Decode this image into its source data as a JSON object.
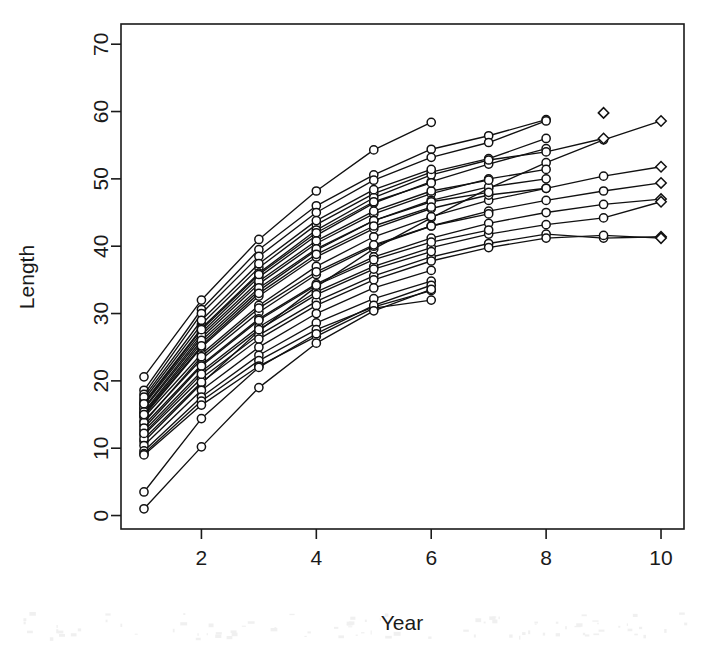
{
  "chart_data": {
    "type": "line",
    "title": "",
    "xlabel": "Year",
    "ylabel": "Length",
    "xlim": [
      0.6,
      10.4
    ],
    "ylim": [
      -2,
      73
    ],
    "xticks": [
      2,
      4,
      6,
      8,
      10
    ],
    "xticklabels": [
      "2",
      "4",
      "6",
      "8",
      "10"
    ],
    "yticks": [
      0,
      10,
      20,
      30,
      40,
      50,
      60,
      70
    ],
    "yticklabels": [
      "0",
      "10",
      "20",
      "30",
      "40",
      "50",
      "60",
      "70"
    ],
    "grid": false,
    "legend": false,
    "marker": "open-circle",
    "end_marker": "open-diamond",
    "line_color": "#111111",
    "marker_fill": "#ffffff",
    "series": [
      {
        "name": "subject-01",
        "x": [
          1,
          2,
          3,
          4,
          5,
          6
        ],
        "values": [
          20.6,
          32.0,
          41.0,
          48.2,
          54.3,
          58.4
        ]
      },
      {
        "name": "subject-02",
        "x": [
          1,
          2,
          3,
          4,
          5,
          6,
          7,
          8
        ],
        "values": [
          18.6,
          30.6,
          39.5,
          46.0,
          50.6,
          54.4,
          56.4,
          58.8
        ]
      },
      {
        "name": "subject-03",
        "x": [
          1,
          2,
          3,
          4,
          5,
          6,
          7,
          8
        ],
        "values": [
          18.0,
          30.0,
          38.5,
          45.0,
          49.8,
          53.2,
          55.4,
          58.6
        ]
      },
      {
        "name": "subject-04",
        "x": [
          1,
          2,
          3,
          4,
          5,
          6,
          7,
          8
        ],
        "values": [
          17.2,
          28.4,
          36.8,
          43.2,
          47.8,
          51.0,
          53.0,
          56.0
        ]
      },
      {
        "name": "subject-05",
        "x": [
          1,
          2,
          3,
          4,
          5,
          6,
          7,
          8
        ],
        "values": [
          16.4,
          27.2,
          35.4,
          41.6,
          46.4,
          49.6,
          52.2,
          54.5
        ]
      },
      {
        "name": "subject-06",
        "x": [
          1,
          2,
          3,
          4,
          5,
          6,
          7,
          8,
          9,
          10
        ],
        "values": [
          11.0,
          19.6,
          27.4,
          34.0,
          39.6,
          44.2,
          48.6,
          52.4,
          55.8,
          58.6
        ]
      },
      {
        "name": "subject-07",
        "x": [
          1,
          2,
          3,
          4,
          5,
          6,
          7,
          8,
          9,
          10
        ],
        "values": [
          14.6,
          24.0,
          31.2,
          37.0,
          41.4,
          44.4,
          46.8,
          48.6,
          50.4,
          51.8
        ]
      },
      {
        "name": "subject-08",
        "x": [
          1,
          2,
          3,
          4,
          5,
          6,
          7,
          8,
          9,
          10
        ],
        "values": [
          14.0,
          23.2,
          30.2,
          35.8,
          40.0,
          43.0,
          45.2,
          46.8,
          48.2,
          49.4
        ]
      },
      {
        "name": "subject-09",
        "x": [
          1,
          2,
          3,
          4,
          5,
          6,
          7,
          8,
          9,
          10
        ],
        "values": [
          13.4,
          22.4,
          29.2,
          34.4,
          38.4,
          41.2,
          43.4,
          45.0,
          46.2,
          47.0
        ]
      },
      {
        "name": "subject-10",
        "x": [
          1,
          2,
          3,
          4,
          5,
          6,
          7,
          8,
          9,
          10
        ],
        "values": [
          12.6,
          21.4,
          28.0,
          33.2,
          37.0,
          39.8,
          41.8,
          43.2,
          44.2,
          46.6
        ]
      },
      {
        "name": "subject-11",
        "x": [
          1,
          2,
          3,
          4,
          5,
          6,
          7,
          8,
          9,
          10
        ],
        "values": [
          12.0,
          20.4,
          26.8,
          31.8,
          35.6,
          38.4,
          40.4,
          41.8,
          41.2,
          41.4
        ]
      },
      {
        "name": "subject-12",
        "x": [
          1,
          2,
          3,
          4,
          5,
          6,
          7,
          8,
          9,
          10
        ],
        "values": [
          11.4,
          19.8,
          26.2,
          31.2,
          35.0,
          37.8,
          39.8,
          41.2,
          41.6,
          41.2
        ]
      },
      {
        "name": "subject-13",
        "x": [
          1,
          2,
          3,
          4,
          5,
          6,
          7,
          8,
          9
        ],
        "values": [
          16.8,
          27.8,
          36.0,
          42.4,
          47.2,
          50.6,
          52.8,
          54.0,
          56.0
        ]
      },
      {
        "name": "subject-14",
        "x": [
          1,
          2,
          3,
          4,
          5,
          6,
          7,
          8
        ],
        "values": [
          15.8,
          26.4,
          34.4,
          40.4,
          44.8,
          47.8,
          50.0,
          51.4
        ]
      },
      {
        "name": "subject-15",
        "x": [
          1,
          2,
          3,
          4,
          5,
          6,
          7,
          8
        ],
        "values": [
          15.2,
          25.6,
          33.4,
          39.4,
          43.8,
          46.8,
          48.8,
          50.0
        ]
      },
      {
        "name": "subject-16",
        "x": [
          1,
          2,
          3,
          4,
          5,
          6,
          7,
          8
        ],
        "values": [
          14.8,
          25.0,
          32.6,
          38.4,
          42.6,
          45.6,
          47.6,
          48.6
        ]
      },
      {
        "name": "subject-17",
        "x": [
          1,
          2,
          3,
          4,
          5,
          6,
          7
        ],
        "values": [
          16.0,
          26.8,
          34.8,
          40.8,
          45.2,
          48.2,
          49.8
        ]
      },
      {
        "name": "subject-18",
        "x": [
          1,
          2,
          3,
          4,
          5,
          6,
          7
        ],
        "values": [
          15.4,
          26.0,
          33.8,
          39.6,
          43.8,
          46.6,
          48.0
        ]
      },
      {
        "name": "subject-19",
        "x": [
          1,
          2,
          3,
          4,
          5,
          6,
          7
        ],
        "values": [
          13.8,
          23.6,
          30.8,
          36.2,
          40.2,
          43.0,
          44.8
        ]
      },
      {
        "name": "subject-20",
        "x": [
          1,
          2,
          3,
          4,
          5,
          6,
          7
        ],
        "values": [
          13.0,
          22.2,
          29.0,
          34.2,
          38.0,
          40.6,
          42.4
        ]
      },
      {
        "name": "subject-21",
        "x": [
          1,
          2,
          3,
          4,
          5,
          6
        ],
        "values": [
          17.6,
          29.0,
          37.4,
          43.8,
          48.4,
          51.4
        ]
      },
      {
        "name": "subject-22",
        "x": [
          1,
          2,
          3,
          4,
          5,
          6
        ],
        "values": [
          16.6,
          27.6,
          35.8,
          42.0,
          46.6,
          49.4
        ]
      },
      {
        "name": "subject-23",
        "x": [
          1,
          2,
          3,
          4,
          5,
          6
        ],
        "values": [
          15.0,
          25.2,
          33.0,
          38.8,
          43.0,
          45.8
        ]
      },
      {
        "name": "subject-24",
        "x": [
          1,
          2,
          3,
          4,
          5,
          6
        ],
        "values": [
          12.2,
          21.0,
          27.6,
          32.8,
          36.6,
          39.2
        ]
      },
      {
        "name": "subject-25",
        "x": [
          1,
          2,
          3,
          4,
          5,
          6
        ],
        "values": [
          10.4,
          18.6,
          25.0,
          30.0,
          33.8,
          36.4
        ]
      },
      {
        "name": "subject-26",
        "x": [
          1,
          2,
          3,
          4,
          5,
          6
        ],
        "values": [
          9.6,
          17.6,
          23.8,
          28.6,
          32.2,
          34.8
        ]
      },
      {
        "name": "subject-27",
        "x": [
          1,
          2,
          3,
          4,
          5,
          6
        ],
        "values": [
          9.2,
          17.0,
          23.0,
          27.6,
          31.0,
          33.4
        ]
      },
      {
        "name": "subject-28",
        "x": [
          1,
          2,
          3,
          4,
          5,
          6
        ],
        "values": [
          9.0,
          16.4,
          22.2,
          26.6,
          30.8,
          32.0
        ]
      },
      {
        "name": "subject-29",
        "x": [
          1,
          2,
          3,
          4,
          5,
          6
        ],
        "values": [
          3.5,
          14.4,
          22.0,
          27.0,
          31.2,
          34.2
        ]
      },
      {
        "name": "subject-30",
        "x": [
          1,
          2,
          3,
          4,
          5,
          6
        ],
        "values": [
          1.0,
          10.2,
          19.0,
          25.6,
          30.4,
          33.6
        ]
      },
      {
        "name": "subject-31",
        "x": [
          9
        ],
        "values": [
          59.8
        ]
      }
    ]
  },
  "figure": {
    "plot_frame_left": 121,
    "plot_frame_top": 24,
    "plot_frame_right": 684,
    "plot_frame_bottom": 529,
    "background": "#ffffff",
    "foreground": "#1a1a1a"
  }
}
